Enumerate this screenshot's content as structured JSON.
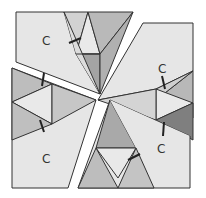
{
  "diagram": {
    "type": "dissection-puzzle",
    "colors": {
      "light": "#e6e6e6",
      "mid": "#c8c8c8",
      "dark": "#a9a9a9",
      "darker": "#8a8a8a",
      "outline": "#333333",
      "background": "#ffffff"
    },
    "pieces": [
      {
        "id": "top-left",
        "label": "C"
      },
      {
        "id": "top-right",
        "label": "C"
      },
      {
        "id": "bottom-left",
        "label": "C"
      },
      {
        "id": "bottom-right",
        "label": "C"
      }
    ]
  }
}
